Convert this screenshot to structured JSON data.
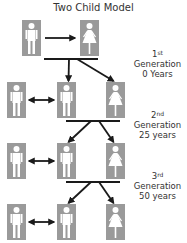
{
  "title": "Two Child Model",
  "colors": {
    "icon_fill": "#9a9a9a",
    "figure": "#ffffff",
    "arrow": "#1a1a1a"
  },
  "generations": [
    {
      "ordinal_num": "1",
      "ordinal_suffix": "st",
      "word": "Generation",
      "time": "0 Years"
    },
    {
      "ordinal_num": "2",
      "ordinal_suffix": "nd",
      "word": "Generation",
      "time": "25 years"
    },
    {
      "ordinal_num": "3",
      "ordinal_suffix": "rd",
      "word": "Generation",
      "time": "50 years"
    }
  ],
  "rows": [
    {
      "icons": [
        "male",
        "female"
      ],
      "connector": "single-arrow"
    },
    {
      "icons": [
        "male",
        "male",
        "female"
      ],
      "connector": "double-arrow"
    },
    {
      "icons": [
        "male",
        "male",
        "female"
      ],
      "connector": "double-arrow"
    },
    {
      "icons": [
        "male",
        "male",
        "female"
      ],
      "connector": "double-arrow"
    }
  ]
}
